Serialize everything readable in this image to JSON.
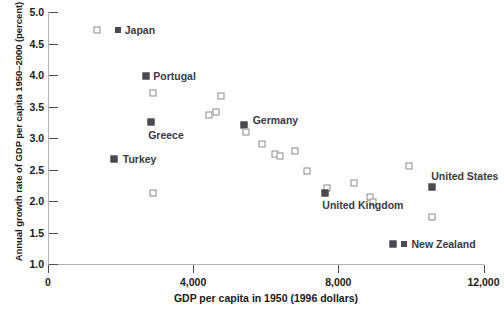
{
  "chart_data": {
    "type": "scatter",
    "title": "",
    "xlabel": "GDP per capita in 1950 (1996 dollars)",
    "ylabel": "Annual growth rate of GDP per capita 1950–2000 (percent)",
    "xlim": [
      0,
      12000
    ],
    "ylim": [
      1.0,
      5.0
    ],
    "xticks": [
      0,
      4000,
      8000,
      12000
    ],
    "xtick_labels": [
      "0",
      "4,000",
      "8,000",
      "12,000"
    ],
    "yticks": [
      1.0,
      1.5,
      2.0,
      2.5,
      3.0,
      3.5,
      4.0,
      4.5,
      5.0
    ],
    "ytick_labels": [
      "1.0",
      "1.5",
      "2.0",
      "2.5",
      "3.0",
      "3.5",
      "4.0",
      "4.5",
      "5.0"
    ],
    "grid": false,
    "legend": "none",
    "series": [
      {
        "name": "countries",
        "marker": "square",
        "points": [
          {
            "x": 1360,
            "y": 4.71,
            "marker": "open",
            "label": "Japan",
            "label_pos": "right"
          },
          {
            "x": 2700,
            "y": 3.98,
            "marker": "filled",
            "label": "Portugal",
            "label_pos": "right"
          },
          {
            "x": 2880,
            "y": 3.72,
            "marker": "open",
            "label": "",
            "label_pos": ""
          },
          {
            "x": 2840,
            "y": 3.26,
            "marker": "filled",
            "label": "Greece",
            "label_pos": "below"
          },
          {
            "x": 1830,
            "y": 2.66,
            "marker": "filled",
            "label": "Turkey",
            "label_pos": "right"
          },
          {
            "x": 2880,
            "y": 2.13,
            "marker": "open",
            "label": "",
            "label_pos": ""
          },
          {
            "x": 4760,
            "y": 3.66,
            "marker": "open",
            "label": "",
            "label_pos": ""
          },
          {
            "x": 4640,
            "y": 3.42,
            "marker": "open",
            "label": "",
            "label_pos": ""
          },
          {
            "x": 4450,
            "y": 3.37,
            "marker": "open",
            "label": "",
            "label_pos": ""
          },
          {
            "x": 5400,
            "y": 3.2,
            "marker": "filled",
            "label": "Germany",
            "label_pos": "right"
          },
          {
            "x": 5460,
            "y": 3.09,
            "marker": "open",
            "label": "",
            "label_pos": ""
          },
          {
            "x": 5900,
            "y": 2.9,
            "marker": "open",
            "label": "",
            "label_pos": ""
          },
          {
            "x": 6250,
            "y": 2.75,
            "marker": "open",
            "label": "",
            "label_pos": ""
          },
          {
            "x": 6380,
            "y": 2.72,
            "marker": "open",
            "label": "",
            "label_pos": ""
          },
          {
            "x": 6800,
            "y": 2.8,
            "marker": "open",
            "label": "",
            "label_pos": ""
          },
          {
            "x": 7150,
            "y": 2.47,
            "marker": "open",
            "label": "",
            "label_pos": ""
          },
          {
            "x": 7680,
            "y": 2.2,
            "marker": "open",
            "label": "",
            "label_pos": ""
          },
          {
            "x": 7620,
            "y": 2.12,
            "marker": "filled",
            "label": "United Kingdom",
            "label_pos": "below"
          },
          {
            "x": 8420,
            "y": 2.28,
            "marker": "open",
            "label": "",
            "label_pos": ""
          },
          {
            "x": 8880,
            "y": 2.06,
            "marker": "open",
            "label": "",
            "label_pos": ""
          },
          {
            "x": 8960,
            "y": 1.99,
            "marker": "open",
            "label": "",
            "label_pos": ""
          },
          {
            "x": 9960,
            "y": 2.55,
            "marker": "open",
            "label": "",
            "label_pos": ""
          },
          {
            "x": 10580,
            "y": 2.23,
            "marker": "filled",
            "label": "United States",
            "label_pos": "above"
          },
          {
            "x": 10580,
            "y": 1.75,
            "marker": "open",
            "label": "",
            "label_pos": ""
          },
          {
            "x": 9500,
            "y": 1.32,
            "marker": "filled",
            "label": "New Zealand",
            "label_pos": "right"
          }
        ]
      }
    ],
    "annotations": [
      {
        "text": "Japan",
        "x": 1840,
        "y": 4.71
      },
      {
        "text": "Portugal",
        "x": 2900,
        "y": 3.98
      },
      {
        "text": "Greece",
        "x": 2760,
        "y": 3.05
      },
      {
        "text": "Turkey",
        "x": 2060,
        "y": 2.66
      },
      {
        "text": "Germany",
        "x": 5640,
        "y": 3.28
      },
      {
        "text": "United Kingdom",
        "x": 7560,
        "y": 1.94
      },
      {
        "text": "United States",
        "x": 10560,
        "y": 2.4
      },
      {
        "text": "New Zealand",
        "x": 9740,
        "y": 1.32
      }
    ]
  }
}
